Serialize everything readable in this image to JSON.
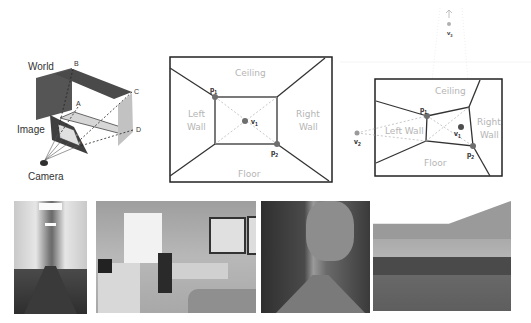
{
  "figure": {
    "panels": {
      "projection": {
        "labels": {
          "world": "World",
          "image": "Image",
          "camera": "Camera",
          "B": "B",
          "A": "A",
          "C": "C",
          "D": "D",
          "b": "b",
          "a": "a",
          "c": "c",
          "d": "d"
        }
      },
      "one_point": {
        "regions": {
          "ceiling": "Ceiling",
          "left_wall_1": "Left",
          "left_wall_2": "Wall",
          "right_wall_1": "Right",
          "right_wall_2": "Wall",
          "floor": "Floor"
        },
        "points": {
          "p1": "p",
          "p1_sub": "1",
          "p2": "p",
          "p2_sub": "2",
          "v1": "v",
          "v1_sub": "1"
        }
      },
      "three_point": {
        "regions": {
          "ceiling": "Ceiling",
          "left_wall": "Left Wall",
          "right_wall_1": "Right",
          "right_wall_2": "Wall",
          "floor": "Floor"
        },
        "points": {
          "p1": "p",
          "p1_sub": "1",
          "p2": "p",
          "p2_sub": "2",
          "v1": "v",
          "v1_sub": "1",
          "v2": "v",
          "v2_sub": "2",
          "v3": "v",
          "v3_sub": "3"
        }
      }
    },
    "photos": [
      {
        "subject": "corridor"
      },
      {
        "subject": "office-room"
      },
      {
        "subject": "narrow-street"
      },
      {
        "subject": "courtyard"
      }
    ],
    "colors": {
      "line": "#2b2b2b",
      "region_label": "#b5b5b5",
      "point": "#6e6e6e",
      "dashed": "#b0b0b0",
      "plane_dark": "#555555",
      "plane_light": "#c8c8c8"
    }
  }
}
